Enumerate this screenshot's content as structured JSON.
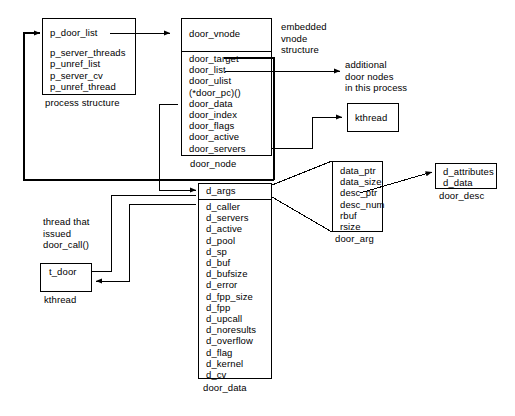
{
  "diagram": {
    "stroke_color": "#000000",
    "background_color": "#ffffff"
  },
  "boxes": {
    "process_structure": {
      "caption": "process structure",
      "head_field": "p_door_list",
      "fields": [
        "p_server_threads",
        "p_unref_list",
        "p_server_cv",
        "p_unref_thread"
      ]
    },
    "door_node": {
      "caption": "door_node",
      "head_field": "door_vnode",
      "fields": [
        "door_target",
        "door_list",
        "door_ulist",
        "(*door_pc)()",
        "door_data",
        "door_index",
        "door_flags",
        "door_active",
        "door_servers"
      ]
    },
    "door_data": {
      "caption": "door_data",
      "head_field": "d_args",
      "fields": [
        "d_caller",
        "d_servers",
        "d_active",
        "d_pool",
        "d_sp",
        "d_buf",
        "d_bufsize",
        "d_error",
        "d_fpp_size",
        "d_fpp",
        "d_upcall",
        "d_noresults",
        "d_overflow",
        "d_flag",
        "d_kernel",
        "d_cv"
      ]
    },
    "door_arg": {
      "caption": "door_arg",
      "fields": [
        "data_ptr",
        "data_size",
        "desc_ptr",
        "desc_num",
        "rbuf",
        "rsize"
      ]
    },
    "door_desc": {
      "caption": "door_desc",
      "fields": [
        "d_attributes",
        "d_data"
      ]
    },
    "kthread_top": {
      "label": "kthread"
    },
    "kthread_bottom": {
      "caption": "kthread",
      "head_field": "t_door"
    }
  },
  "annotations": {
    "embedded_vnode": [
      "embedded",
      "vnode",
      "structure"
    ],
    "additional_nodes": [
      "additional",
      "door nodes",
      "in this process"
    ],
    "calling_thread": [
      "thread that",
      "issued",
      "door_call()"
    ]
  }
}
